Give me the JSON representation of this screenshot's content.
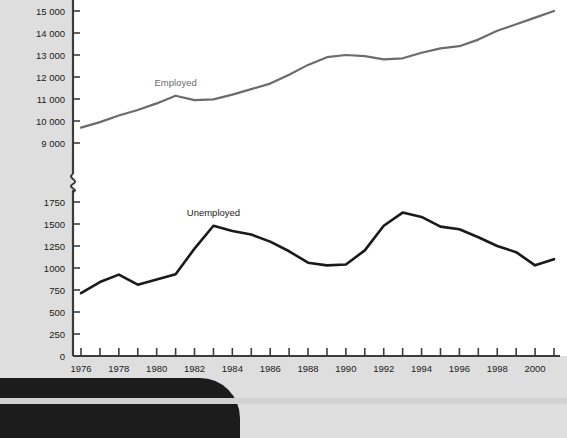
{
  "chart_data": {
    "type": "line",
    "title": "",
    "subtitle": "",
    "xlabel": "",
    "ylabel": "",
    "grid": false,
    "legend_position": "inline-annotation",
    "axis_break": true,
    "axis_break_note": "Y axis is broken between 1750 and 9000",
    "x": [
      1976,
      1977,
      1978,
      1979,
      1980,
      1981,
      1982,
      1983,
      1984,
      1985,
      1986,
      1987,
      1988,
      1989,
      1990,
      1991,
      1992,
      1993,
      1994,
      1995,
      1996,
      1997,
      1998,
      1999,
      2000,
      2001
    ],
    "x_tick_labels": [
      "1976",
      "1978",
      "1980",
      "1982",
      "1984",
      "1986",
      "1988",
      "1990",
      "1992",
      "1994",
      "1996",
      "1998",
      "2000"
    ],
    "x_tick_values": [
      1976,
      1978,
      1980,
      1982,
      1984,
      1986,
      1988,
      1990,
      1992,
      1994,
      1996,
      1998,
      2000
    ],
    "xlim": [
      1976,
      2001
    ],
    "upper_axis": {
      "ylim": [
        9000,
        15000
      ],
      "ticks": [
        9000,
        10000,
        11000,
        12000,
        13000,
        14000,
        15000
      ],
      "tick_labels": [
        "9 000",
        "10 000",
        "11 000",
        "12 000",
        "13 000",
        "14 000",
        "15 000"
      ]
    },
    "lower_axis": {
      "ylim": [
        0,
        1750
      ],
      "ticks": [
        0,
        250,
        500,
        750,
        1000,
        1250,
        1500,
        1750
      ],
      "tick_labels": [
        "0",
        "250",
        "500",
        "750",
        "1000",
        "1250",
        "1500",
        "1750"
      ]
    },
    "series": [
      {
        "name": "Employed",
        "label": "Employed",
        "color": "#6b6b6b",
        "axis": "upper",
        "values": [
          9700,
          9950,
          10250,
          10500,
          10800,
          11150,
          10950,
          10980,
          11200,
          11450,
          11700,
          12100,
          12550,
          12900,
          13000,
          12950,
          12800,
          12850,
          13100,
          13300,
          13400,
          13700,
          14100,
          14400,
          14700,
          15000
        ]
      },
      {
        "name": "Unemployed",
        "label": "Unemployed",
        "color": "#1a1a1a",
        "axis": "lower",
        "values": [
          715,
          840,
          925,
          810,
          870,
          930,
          1220,
          1480,
          1420,
          1380,
          1300,
          1190,
          1060,
          1030,
          1040,
          1200,
          1480,
          1630,
          1580,
          1470,
          1440,
          1350,
          1250,
          1180,
          1030,
          1100
        ]
      }
    ],
    "annotations": [
      {
        "text": "Employed",
        "x": 1981,
        "y": 11150,
        "color": "#6b6b6b"
      },
      {
        "text": "Unemployed",
        "x": 1983,
        "y": 1480,
        "color": "#1a1a1a"
      }
    ]
  },
  "colors": {
    "employed_line": "#6b6b6b",
    "unemployed_line": "#1a1a1a",
    "axis": "#3c3c3c",
    "plot_background": "#ffffff",
    "page_background": "#dedede",
    "corner_band": "#1c1c1c"
  }
}
